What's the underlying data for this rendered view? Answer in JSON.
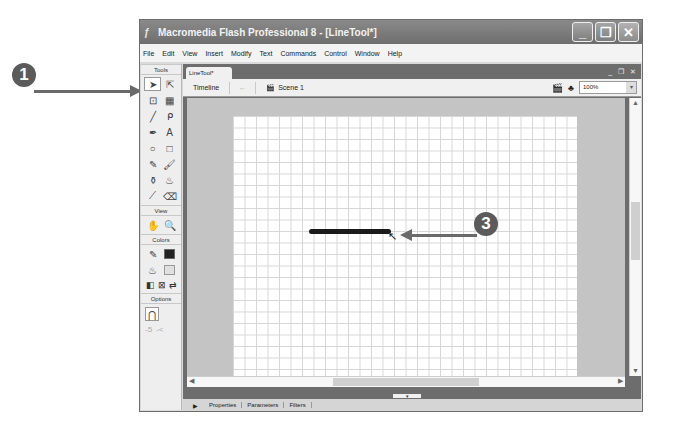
{
  "window": {
    "title": "Macromedia Flash Professional 8 - [LineTool*]",
    "controls": {
      "minimize": "_",
      "maximize": "❐",
      "close": "✕"
    }
  },
  "menubar": [
    "File",
    "Edit",
    "View",
    "Insert",
    "Modify",
    "Text",
    "Commands",
    "Control",
    "Window",
    "Help"
  ],
  "toolbox": {
    "tools_header": "Tools",
    "tools": [
      {
        "name": "selection-tool",
        "glyph": "➤"
      },
      {
        "name": "subselection-tool",
        "glyph": "⇱"
      },
      {
        "name": "free-transform-tool",
        "glyph": "⊡"
      },
      {
        "name": "gradient-transform-tool",
        "glyph": "▦"
      },
      {
        "name": "line-tool",
        "glyph": "╱"
      },
      {
        "name": "lasso-tool",
        "glyph": "ᑭ"
      },
      {
        "name": "pen-tool",
        "glyph": "✒"
      },
      {
        "name": "text-tool",
        "glyph": "A"
      },
      {
        "name": "oval-tool",
        "glyph": "○"
      },
      {
        "name": "rectangle-tool",
        "glyph": "□"
      },
      {
        "name": "pencil-tool",
        "glyph": "✎"
      },
      {
        "name": "brush-tool",
        "glyph": "🖌"
      },
      {
        "name": "ink-bottle-tool",
        "glyph": "⚱"
      },
      {
        "name": "paint-bucket-tool",
        "glyph": "♨"
      },
      {
        "name": "eyedropper-tool",
        "glyph": "⟋"
      },
      {
        "name": "eraser-tool",
        "glyph": "⌫"
      }
    ],
    "view_header": "View",
    "view_tools": [
      {
        "name": "hand-tool",
        "glyph": "✋"
      },
      {
        "name": "zoom-tool",
        "glyph": "🔍"
      }
    ],
    "colors_header": "Colors",
    "colors": {
      "stroke": "#222222",
      "fill": "#e0e0e0"
    },
    "color_buttons": [
      "◧",
      "⊠",
      "⇄"
    ],
    "options_header": "Options",
    "options": [
      {
        "name": "snap-to-objects",
        "glyph": "⋂"
      },
      {
        "name": "smooth",
        "glyph": "-5"
      },
      {
        "name": "straighten",
        "glyph": "-<"
      }
    ]
  },
  "document": {
    "tab": "LineTool*",
    "doc_controls": "_ ❐ ✕",
    "timeline_button": "Timeline",
    "back_arrow": "←",
    "scene": "Scene 1",
    "zoom": "100%"
  },
  "panels": {
    "expand": "▶",
    "tabs": [
      "Properties",
      "Parameters",
      "Filters"
    ]
  },
  "callouts": [
    {
      "number": "1",
      "target": "selection-tool"
    },
    {
      "number": "3",
      "target": "line-end-point"
    }
  ]
}
